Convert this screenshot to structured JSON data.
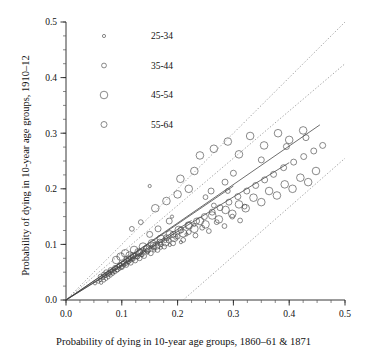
{
  "chart_data": {
    "type": "scatter",
    "title": "",
    "xlabel": "Probability of dying in 10-year age groups, 1860–61 & 1871",
    "ylabel": "Probability of dying in 10-year age groups, 1910–12",
    "xlim": [
      0.0,
      0.5
    ],
    "ylim": [
      0.0,
      0.5
    ],
    "xticks": [
      "0.0",
      "0.1",
      "0.2",
      "0.3",
      "0.4",
      "0.5"
    ],
    "yticks": [
      "0.0",
      "0.1",
      "0.2",
      "0.3",
      "0.4",
      "0.5"
    ],
    "xtickvals": [
      0.0,
      0.1,
      0.2,
      0.3,
      0.4,
      0.5
    ],
    "ytickvals": [
      0.0,
      0.1,
      0.2,
      0.3,
      0.4,
      0.5
    ],
    "minor_tick_step": 0.025,
    "grid": false,
    "legend_position": "upper-left",
    "legend": [
      {
        "label": "25-34",
        "marker": "circle",
        "marker_size": 1.6
      },
      {
        "label": "35-44",
        "marker": "circle",
        "marker_size": 2.4
      },
      {
        "label": "45-54",
        "marker": "circle",
        "marker_size": 3.8
      },
      {
        "label": "55-64",
        "marker": "circle",
        "marker_size": 3.0
      }
    ],
    "reference_lines": [
      {
        "name": "upper-dotted-band",
        "style": "dotted",
        "x0": 0.0,
        "y0": 0.0,
        "x1": 0.5,
        "y1": 0.5
      },
      {
        "name": "mid-dotted-band",
        "style": "dotted",
        "x0": 0.0,
        "y0": 0.0,
        "x1": 0.5,
        "y1": 0.425
      },
      {
        "name": "lower-dotted-band",
        "style": "dotted",
        "x0": 0.21,
        "y0": 0.0,
        "x1": 0.5,
        "y1": 0.255
      }
    ],
    "regression_lines": [
      {
        "series": "25-34",
        "x0": 0.0,
        "y0": 0.0,
        "x1": 0.225,
        "y1": 0.143
      },
      {
        "series": "35-44",
        "x0": 0.0,
        "y0": 0.0,
        "x1": 0.3,
        "y1": 0.205
      },
      {
        "series": "45-54",
        "x0": 0.0,
        "y0": 0.0,
        "x1": 0.455,
        "y1": 0.315
      },
      {
        "series": "55-64",
        "x0": 0.0,
        "y0": 0.0,
        "x1": 0.4,
        "y1": 0.247
      }
    ],
    "series": [
      {
        "name": "25-34",
        "marker": "circle",
        "marker_size": 1.6,
        "points": [
          [
            0.052,
            0.03
          ],
          [
            0.058,
            0.033
          ],
          [
            0.061,
            0.036
          ],
          [
            0.063,
            0.031
          ],
          [
            0.066,
            0.04
          ],
          [
            0.068,
            0.035
          ],
          [
            0.07,
            0.043
          ],
          [
            0.072,
            0.038
          ],
          [
            0.074,
            0.046
          ],
          [
            0.076,
            0.041
          ],
          [
            0.078,
            0.049
          ],
          [
            0.08,
            0.044
          ],
          [
            0.082,
            0.052
          ],
          [
            0.084,
            0.047
          ],
          [
            0.086,
            0.055
          ],
          [
            0.088,
            0.05
          ],
          [
            0.09,
            0.058
          ],
          [
            0.092,
            0.053
          ],
          [
            0.094,
            0.061
          ],
          [
            0.096,
            0.056
          ],
          [
            0.098,
            0.064
          ],
          [
            0.1,
            0.059
          ],
          [
            0.102,
            0.067
          ],
          [
            0.104,
            0.062
          ],
          [
            0.106,
            0.07
          ],
          [
            0.108,
            0.065
          ],
          [
            0.11,
            0.073
          ],
          [
            0.112,
            0.068
          ],
          [
            0.114,
            0.076
          ],
          [
            0.116,
            0.071
          ],
          [
            0.118,
            0.079
          ],
          [
            0.12,
            0.074
          ],
          [
            0.124,
            0.082
          ],
          [
            0.128,
            0.077
          ],
          [
            0.132,
            0.086
          ],
          [
            0.136,
            0.081
          ],
          [
            0.14,
            0.09
          ],
          [
            0.146,
            0.085
          ],
          [
            0.152,
            0.095
          ],
          [
            0.158,
            0.089
          ],
          [
            0.164,
            0.1
          ],
          [
            0.17,
            0.094
          ],
          [
            0.178,
            0.106
          ],
          [
            0.186,
            0.099
          ],
          [
            0.196,
            0.112
          ],
          [
            0.206,
            0.104
          ],
          [
            0.216,
            0.118
          ],
          [
            0.15,
            0.205
          ],
          [
            0.19,
            0.15
          ],
          [
            0.23,
            0.135
          ]
        ]
      },
      {
        "name": "35-44",
        "marker": "circle",
        "marker_size": 2.4,
        "points": [
          [
            0.062,
            0.042
          ],
          [
            0.068,
            0.046
          ],
          [
            0.072,
            0.05
          ],
          [
            0.076,
            0.047
          ],
          [
            0.08,
            0.054
          ],
          [
            0.084,
            0.051
          ],
          [
            0.088,
            0.058
          ],
          [
            0.092,
            0.055
          ],
          [
            0.096,
            0.062
          ],
          [
            0.1,
            0.059
          ],
          [
            0.104,
            0.066
          ],
          [
            0.108,
            0.063
          ],
          [
            0.112,
            0.07
          ],
          [
            0.116,
            0.067
          ],
          [
            0.12,
            0.074
          ],
          [
            0.124,
            0.071
          ],
          [
            0.128,
            0.078
          ],
          [
            0.132,
            0.075
          ],
          [
            0.136,
            0.082
          ],
          [
            0.14,
            0.079
          ],
          [
            0.146,
            0.088
          ],
          [
            0.152,
            0.084
          ],
          [
            0.158,
            0.094
          ],
          [
            0.164,
            0.09
          ],
          [
            0.17,
            0.1
          ],
          [
            0.176,
            0.096
          ],
          [
            0.184,
            0.107
          ],
          [
            0.192,
            0.102
          ],
          [
            0.2,
            0.114
          ],
          [
            0.21,
            0.108
          ],
          [
            0.22,
            0.122
          ],
          [
            0.232,
            0.116
          ],
          [
            0.244,
            0.13
          ],
          [
            0.256,
            0.124
          ],
          [
            0.27,
            0.14
          ],
          [
            0.284,
            0.133
          ],
          [
            0.298,
            0.15
          ],
          [
            0.312,
            0.143
          ],
          [
            0.118,
            0.128
          ],
          [
            0.134,
            0.14
          ],
          [
            0.25,
            0.185
          ],
          [
            0.265,
            0.17
          ],
          [
            0.29,
            0.196
          ],
          [
            0.32,
            0.168
          ]
        ]
      },
      {
        "name": "45-54",
        "marker": "circle",
        "marker_size": 3.8,
        "points": [
          [
            0.09,
            0.072
          ],
          [
            0.098,
            0.078
          ],
          [
            0.106,
            0.084
          ],
          [
            0.114,
            0.08
          ],
          [
            0.122,
            0.09
          ],
          [
            0.13,
            0.086
          ],
          [
            0.138,
            0.096
          ],
          [
            0.146,
            0.092
          ],
          [
            0.154,
            0.102
          ],
          [
            0.162,
            0.098
          ],
          [
            0.17,
            0.11
          ],
          [
            0.178,
            0.104
          ],
          [
            0.186,
            0.118
          ],
          [
            0.194,
            0.112
          ],
          [
            0.202,
            0.126
          ],
          [
            0.21,
            0.12
          ],
          [
            0.22,
            0.134
          ],
          [
            0.23,
            0.128
          ],
          [
            0.24,
            0.142
          ],
          [
            0.25,
            0.136
          ],
          [
            0.262,
            0.152
          ],
          [
            0.274,
            0.145
          ],
          [
            0.286,
            0.162
          ],
          [
            0.298,
            0.155
          ],
          [
            0.31,
            0.172
          ],
          [
            0.322,
            0.165
          ],
          [
            0.336,
            0.184
          ],
          [
            0.35,
            0.176
          ],
          [
            0.364,
            0.196
          ],
          [
            0.378,
            0.188
          ],
          [
            0.392,
            0.208
          ],
          [
            0.406,
            0.2
          ],
          [
            0.42,
            0.22
          ],
          [
            0.434,
            0.212
          ],
          [
            0.448,
            0.232
          ],
          [
            0.24,
            0.26
          ],
          [
            0.265,
            0.272
          ],
          [
            0.29,
            0.285
          ],
          [
            0.31,
            0.262
          ],
          [
            0.33,
            0.295
          ],
          [
            0.355,
            0.278
          ],
          [
            0.38,
            0.3
          ],
          [
            0.4,
            0.288
          ],
          [
            0.425,
            0.305
          ],
          [
            0.16,
            0.165
          ],
          [
            0.18,
            0.178
          ],
          [
            0.2,
            0.19
          ],
          [
            0.22,
            0.2
          ],
          [
            0.205,
            0.218
          ],
          [
            0.23,
            0.232
          ]
        ]
      },
      {
        "name": "55-64",
        "marker": "circle",
        "marker_size": 3.0,
        "points": [
          [
            0.11,
            0.074
          ],
          [
            0.12,
            0.08
          ],
          [
            0.132,
            0.086
          ],
          [
            0.144,
            0.092
          ],
          [
            0.156,
            0.098
          ],
          [
            0.168,
            0.104
          ],
          [
            0.18,
            0.112
          ],
          [
            0.192,
            0.118
          ],
          [
            0.206,
            0.126
          ],
          [
            0.22,
            0.134
          ],
          [
            0.234,
            0.142
          ],
          [
            0.248,
            0.15
          ],
          [
            0.262,
            0.158
          ],
          [
            0.276,
            0.166
          ],
          [
            0.292,
            0.176
          ],
          [
            0.308,
            0.186
          ],
          [
            0.324,
            0.196
          ],
          [
            0.34,
            0.206
          ],
          [
            0.356,
            0.216
          ],
          [
            0.372,
            0.226
          ],
          [
            0.39,
            0.238
          ],
          [
            0.408,
            0.248
          ],
          [
            0.426,
            0.258
          ],
          [
            0.444,
            0.268
          ],
          [
            0.46,
            0.278
          ],
          [
            0.15,
            0.118
          ],
          [
            0.165,
            0.128
          ],
          [
            0.185,
            0.142
          ],
          [
            0.26,
            0.196
          ],
          [
            0.285,
            0.212
          ],
          [
            0.3,
            0.228
          ],
          [
            0.35,
            0.252
          ],
          [
            0.395,
            0.276
          ],
          [
            0.43,
            0.292
          ]
        ]
      }
    ]
  }
}
